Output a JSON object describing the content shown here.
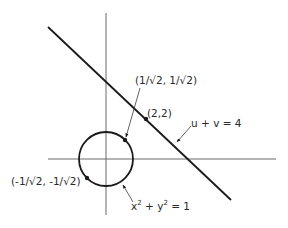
{
  "figure": {
    "type": "diagram",
    "colors": {
      "axis": "#6b6b6b",
      "curve": "#1a1a1a",
      "text": "#2a2a2a",
      "background": "#ffffff"
    },
    "axes": {
      "origin_px": [
        106,
        159
      ],
      "x_axis": {
        "from_px": [
          48,
          159
        ],
        "to_px": [
          276,
          159
        ]
      },
      "y_axis": {
        "from_px": [
          106,
          13
        ],
        "to_px": [
          106,
          215
        ]
      }
    },
    "circle": {
      "equation_label": {
        "base_x": "x",
        "exp_x": "2",
        "plus": " + ",
        "base_y": "y",
        "exp_y": "2",
        "rhs": " = 1"
      },
      "center_px": [
        106,
        159
      ],
      "radius_px": 27
    },
    "line": {
      "label": "u + v = 4",
      "from_px": [
        48,
        27
      ],
      "to_px": [
        231,
        200
      ]
    },
    "points": [
      {
        "label": "(1/√2, 1/√2)",
        "px": [
          125,
          140
        ]
      },
      {
        "label": "(2,2)",
        "px": [
          146,
          119
        ]
      },
      {
        "label": "(-1/√2, -1/√2)",
        "px": [
          87,
          178
        ]
      }
    ],
    "leaders": [
      {
        "for": "point-1",
        "from_px": [
          140,
          88
        ],
        "to_px": [
          126,
          137
        ]
      },
      {
        "for": "line",
        "from_px": [
          191,
          126
        ],
        "to_px": [
          177,
          142
        ]
      },
      {
        "for": "circle",
        "from_px": [
          133,
          202
        ],
        "to_px": [
          123,
          185
        ]
      }
    ]
  }
}
